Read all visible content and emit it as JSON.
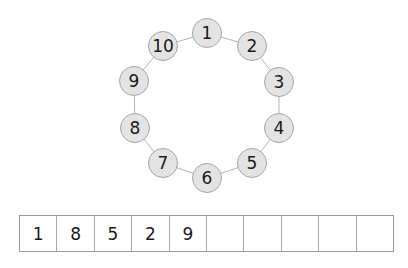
{
  "diagram": {
    "type": "number-ring",
    "nodes": [
      {
        "label": "1",
        "x": 207,
        "y": 33
      },
      {
        "label": "2",
        "x": 252,
        "y": 46
      },
      {
        "label": "3",
        "x": 279,
        "y": 82
      },
      {
        "label": "4",
        "x": 279,
        "y": 128
      },
      {
        "label": "5",
        "x": 252,
        "y": 163
      },
      {
        "label": "6",
        "x": 207,
        "y": 178
      },
      {
        "label": "7",
        "x": 163,
        "y": 163
      },
      {
        "label": "8",
        "x": 135,
        "y": 128
      },
      {
        "label": "9",
        "x": 134,
        "y": 81
      },
      {
        "label": "10",
        "x": 163,
        "y": 46
      }
    ],
    "colors": {
      "node_fill": "#e3e3e3",
      "node_border": "#a6a6a6",
      "edge": "#b5b5b5"
    }
  },
  "answer_table": {
    "cells": [
      "1",
      "8",
      "5",
      "2",
      "9",
      "",
      "",
      "",
      "",
      ""
    ]
  }
}
